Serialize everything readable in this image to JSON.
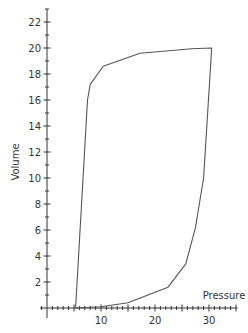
{
  "chart_data": {
    "type": "line",
    "title": "",
    "xlabel": "Pressure",
    "ylabel": "Volume",
    "xlim": [
      0,
      35
    ],
    "ylim": [
      0,
      23
    ],
    "grid": false,
    "legend": null,
    "x_tick_labels": [
      10,
      20,
      30
    ],
    "y_tick_labels": [
      2,
      4,
      6,
      8,
      10,
      12,
      14,
      16,
      18,
      20,
      22
    ],
    "series": [
      {
        "name": "Pressure-Volume loop",
        "closed": true,
        "color": "#555555",
        "points": [
          {
            "x": 5.3,
            "y": 0.0
          },
          {
            "x": 7.5,
            "y": 16.0
          },
          {
            "x": 8.0,
            "y": 17.2
          },
          {
            "x": 10.4,
            "y": 18.6
          },
          {
            "x": 17.2,
            "y": 19.6
          },
          {
            "x": 26.8,
            "y": 19.95
          },
          {
            "x": 30.5,
            "y": 20.0
          },
          {
            "x": 29.0,
            "y": 10.0
          },
          {
            "x": 27.5,
            "y": 6.2
          },
          {
            "x": 25.7,
            "y": 3.4
          },
          {
            "x": 22.4,
            "y": 1.6
          },
          {
            "x": 15.0,
            "y": 0.4
          },
          {
            "x": 10.0,
            "y": 0.1
          },
          {
            "x": 5.3,
            "y": 0.0
          }
        ]
      }
    ]
  },
  "layout": {
    "origin_px": [
      47,
      308
    ],
    "px_per_x": 5.4,
    "px_per_y": 13,
    "axis_color": "#333333",
    "line_color": "#555555"
  }
}
